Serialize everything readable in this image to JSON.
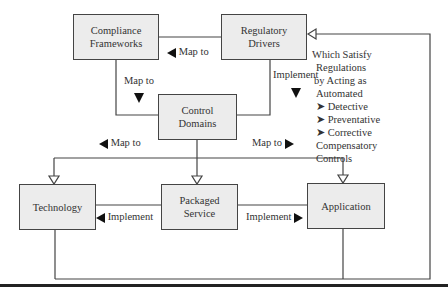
{
  "diagram": {
    "nodes": {
      "compliance_frameworks": "Compliance Frameworks",
      "compliance_line1": "Compliance",
      "compliance_line2": "Frameworks",
      "regulatory_line1": "Regulatory",
      "regulatory_line2": "Drivers",
      "control_line1": "Control",
      "control_line2": "Domains",
      "technology": "Technology",
      "packaged_line1": "Packaged",
      "packaged_line2": "Service",
      "application": "Application"
    },
    "edge_labels": {
      "regulatory_to_compliance": "Map to",
      "compliance_to_control": "Map to",
      "regulatory_to_control": "Implement",
      "control_to_technology": "Map to",
      "control_to_application": "Map to",
      "packaged_to_technology": "Implement",
      "packaged_to_application": "Implement"
    },
    "note": {
      "lines": [
        "Which Satisfy",
        "Regulations",
        "by Acting as",
        "Automated"
      ],
      "bullets": [
        "Detective",
        "Preventative",
        "Corrective"
      ],
      "tail": [
        "Compensatory",
        "Controls"
      ],
      "bullet_glyph": "➤"
    },
    "colors": {
      "box_fill": "#ececec",
      "line": "#444444",
      "arrow": "#111111"
    }
  }
}
